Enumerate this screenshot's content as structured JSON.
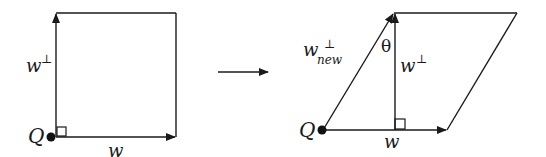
{
  "diagram": {
    "left": {
      "origin_label": "Q",
      "horizontal_vector_label": "w",
      "vertical_vector_label": "w",
      "vertical_vector_superscript": "⊥"
    },
    "transform_arrow": "→",
    "right": {
      "origin_label": "Q",
      "horizontal_vector_label": "w",
      "vertical_vector_label": "w",
      "vertical_vector_superscript": "⊥",
      "slanted_vector_label": "w",
      "slanted_vector_superscript": "⊥",
      "slanted_vector_subscript": "new",
      "angle_label": "θ"
    },
    "colors": {
      "stroke": "#1a1a1a",
      "background": "#ffffff"
    }
  }
}
